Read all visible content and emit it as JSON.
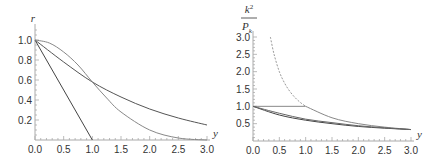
{
  "chart_data": [
    {
      "type": "line",
      "title": "",
      "xlabel": "y",
      "ylabel": "r",
      "xlim": [
        0,
        3.0
      ],
      "ylim": [
        0,
        1.1
      ],
      "grid": false,
      "legend": null,
      "x_ticks": [
        "0.0",
        "0.5",
        "1.0",
        "1.5",
        "2.0",
        "2.5",
        "3.0"
      ],
      "y_ticks": [
        "0.2",
        "0.4",
        "0.6",
        "0.8",
        "1.0"
      ],
      "series": [
        {
          "name": "linear",
          "style": "solid",
          "color": "#444444",
          "x": [
            0,
            1.0
          ],
          "y": [
            1.0,
            0.0
          ]
        },
        {
          "name": "slow-decay",
          "style": "solid",
          "color": "#555555",
          "x": [
            0,
            0.5,
            1.0,
            1.5,
            2.0,
            2.5,
            3.0
          ],
          "y": [
            1.0,
            0.78,
            0.58,
            0.43,
            0.31,
            0.22,
            0.15
          ]
        },
        {
          "name": "gaussian",
          "style": "solid",
          "color": "#888888",
          "x": [
            0,
            0.25,
            0.5,
            0.75,
            1.0,
            1.25,
            1.5,
            2.0,
            2.5,
            3.0
          ],
          "y": [
            1.0,
            0.97,
            0.88,
            0.75,
            0.58,
            0.42,
            0.28,
            0.1,
            0.02,
            0.0
          ]
        }
      ]
    },
    {
      "type": "line",
      "title": "",
      "xlabel": "y",
      "ylabel": "k²/P_k",
      "ylabel_numerator": "k",
      "ylabel_sup": "2",
      "ylabel_denominator": "P",
      "ylabel_sub": "k",
      "xlim": [
        0,
        3.0
      ],
      "ylim": [
        0,
        3.0
      ],
      "grid": false,
      "legend": null,
      "x_ticks": [
        "0.0",
        "0.5",
        "1.0",
        "1.5",
        "2.0",
        "2.5",
        "3.0"
      ],
      "y_ticks": [
        "0.5",
        "1.0",
        "1.5",
        "2.0",
        "2.5",
        "3.0"
      ],
      "series": [
        {
          "name": "dashed-1/y",
          "style": "dashed",
          "color": "#999999",
          "x": [
            0.33,
            0.4,
            0.5,
            0.6,
            0.7,
            0.8,
            0.9,
            1.0
          ],
          "y": [
            3.0,
            2.5,
            2.0,
            1.67,
            1.43,
            1.25,
            1.11,
            1.0
          ]
        },
        {
          "name": "flat-then-1/y",
          "style": "solid",
          "color": "#888888",
          "x": [
            0,
            1.0,
            1.5,
            2.0,
            2.5,
            3.0
          ],
          "y": [
            1.0,
            1.0,
            0.67,
            0.5,
            0.4,
            0.33
          ]
        },
        {
          "name": "lower-curve-a",
          "style": "solid",
          "color": "#444444",
          "x": [
            0,
            0.5,
            1.0,
            1.5,
            2.0,
            2.5,
            3.0
          ],
          "y": [
            1.0,
            0.75,
            0.6,
            0.5,
            0.42,
            0.37,
            0.33
          ]
        },
        {
          "name": "lower-curve-b",
          "style": "solid",
          "color": "#666666",
          "x": [
            0,
            0.5,
            1.0,
            1.5,
            2.0,
            2.5,
            3.0
          ],
          "y": [
            1.0,
            0.8,
            0.63,
            0.53,
            0.44,
            0.38,
            0.33
          ]
        }
      ]
    }
  ]
}
